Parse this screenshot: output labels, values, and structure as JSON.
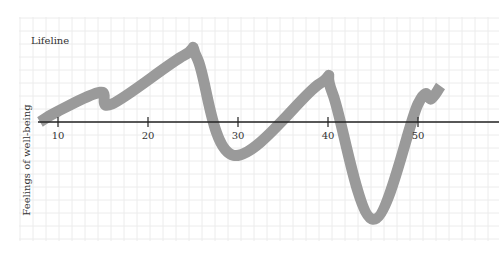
{
  "chart_data": {
    "type": "line",
    "title": "Lifeline",
    "xlabel": "",
    "ylabel": "Feelings of well-being",
    "x_ticks": [
      10,
      20,
      30,
      40,
      50
    ],
    "xlim": [
      5,
      57
    ],
    "grid": true,
    "legend": null,
    "series": [
      {
        "name": "Lifeline",
        "color": "#9a9a9a",
        "x": [
          8,
          10,
          14.7,
          16,
          24,
          25.5,
          29.5,
          39,
          40.5,
          45,
          50,
          51.5,
          52.5
        ],
        "y": [
          0,
          1.2,
          3.3,
          2.0,
          7.4,
          7.0,
          -3.7,
          4.2,
          3.2,
          -10.8,
          2.0,
          2.6,
          4.0
        ]
      }
    ]
  },
  "labels": {
    "title": "Lifeline",
    "ylabel": "Feelings of well-being",
    "ticks": [
      "10",
      "20",
      "30",
      "40",
      "50"
    ]
  },
  "colors": {
    "line": "#9a9a9a",
    "axis": "#222222",
    "grid": "#ececec"
  }
}
